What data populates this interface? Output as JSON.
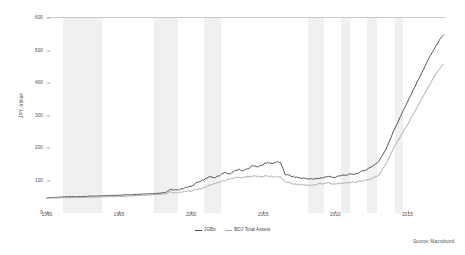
{
  "chart_data": {
    "type": "line",
    "title": "",
    "subtitle": "",
    "xlabel": "",
    "ylabel": "JPY, trillion",
    "xlim": [
      1990,
      2017.6
    ],
    "ylim": [
      0,
      600
    ],
    "grid": false,
    "legend_position": "bottom-center",
    "source": "Source: Macrobond",
    "y_ticks": [
      0,
      100,
      200,
      300,
      400,
      500,
      600
    ],
    "y_tick_labels": [
      "0",
      "100",
      "200",
      "300",
      "400",
      "500",
      "600"
    ],
    "x_ticks": [
      1990,
      1995,
      2000,
      2005,
      2010,
      2015
    ],
    "x_tick_labels": [
      "1990",
      "1995",
      "2000",
      "2005",
      "2010",
      "2015"
    ],
    "colors": {
      "jgbs": "#4c4c4c",
      "boj_total_assets": "#a6a6a6",
      "recession_band": "#f0f0f0",
      "axis": "#b9b9b9",
      "text": "#4a4a4a"
    },
    "recession_bands": [
      {
        "start": 1991.1,
        "end": 1993.8
      },
      {
        "start": 1997.4,
        "end": 1999.1
      },
      {
        "start": 2000.9,
        "end": 2002.1
      },
      {
        "start": 2008.1,
        "end": 2009.2
      },
      {
        "start": 2010.4,
        "end": 2011.0
      },
      {
        "start": 2012.2,
        "end": 2012.9
      },
      {
        "start": 2014.1,
        "end": 2014.7
      }
    ],
    "series": [
      {
        "name": "JGBs",
        "color": "#4c4c4c",
        "x": [
          1990.0,
          1990.5,
          1991.0,
          1991.5,
          1992.0,
          1992.5,
          1993.0,
          1993.5,
          1994.0,
          1994.5,
          1995.0,
          1995.5,
          1996.0,
          1996.5,
          1997.0,
          1997.5,
          1998.0,
          1998.3,
          1998.6,
          1999.0,
          1999.3,
          1999.6,
          2000.0,
          2000.3,
          2000.6,
          2001.0,
          2001.3,
          2001.6,
          2002.0,
          2002.3,
          2002.6,
          2003.0,
          2003.3,
          2003.6,
          2004.0,
          2004.3,
          2004.6,
          2005.0,
          2005.3,
          2005.6,
          2006.0,
          2006.2,
          2006.5,
          2007.0,
          2007.5,
          2008.0,
          2008.5,
          2009.0,
          2009.5,
          2010.0,
          2010.5,
          2011.0,
          2011.5,
          2012.0,
          2012.5,
          2013.0,
          2013.5,
          2014.0,
          2014.5,
          2015.0,
          2015.5,
          2016.0,
          2016.5,
          2017.0,
          2017.3,
          2017.5
        ],
        "y": [
          47,
          48,
          49,
          50,
          50,
          51,
          52,
          52,
          53,
          54,
          55,
          56,
          57,
          58,
          59,
          60,
          62,
          66,
          72,
          70,
          74,
          78,
          82,
          92,
          96,
          106,
          112,
          108,
          116,
          124,
          120,
          128,
          134,
          130,
          138,
          146,
          141,
          150,
          156,
          152,
          158,
          155,
          120,
          112,
          108,
          106,
          104,
          108,
          112,
          110,
          116,
          118,
          122,
          130,
          142,
          158,
          196,
          248,
          296,
          342,
          388,
          432,
          478,
          516,
          538,
          548
        ]
      },
      {
        "name": "BOJ Total Assets",
        "color": "#a6a6a6",
        "x": [
          1990.0,
          1990.5,
          1991.0,
          1991.5,
          1992.0,
          1992.5,
          1993.0,
          1993.5,
          1994.0,
          1994.5,
          1995.0,
          1995.5,
          1996.0,
          1996.5,
          1997.0,
          1997.5,
          1998.0,
          1998.3,
          1998.6,
          1999.0,
          1999.3,
          1999.6,
          2000.0,
          2000.3,
          2000.6,
          2001.0,
          2001.3,
          2001.6,
          2002.0,
          2002.3,
          2002.6,
          2003.0,
          2003.3,
          2003.6,
          2004.0,
          2004.3,
          2004.6,
          2005.0,
          2005.3,
          2005.6,
          2006.0,
          2006.2,
          2006.5,
          2007.0,
          2007.5,
          2008.0,
          2008.5,
          2009.0,
          2009.5,
          2010.0,
          2010.5,
          2011.0,
          2011.5,
          2012.0,
          2012.5,
          2013.0,
          2013.5,
          2014.0,
          2014.5,
          2015.0,
          2015.5,
          2016.0,
          2016.5,
          2017.0,
          2017.3,
          2017.5
        ],
        "y": [
          46,
          46,
          47,
          47,
          48,
          48,
          49,
          49,
          50,
          50,
          51,
          52,
          53,
          54,
          55,
          56,
          58,
          60,
          64,
          62,
          64,
          66,
          68,
          72,
          74,
          80,
          86,
          90,
          96,
          100,
          104,
          108,
          110,
          110,
          112,
          113,
          112,
          113,
          113,
          112,
          112,
          110,
          96,
          90,
          88,
          86,
          86,
          90,
          92,
          90,
          92,
          94,
          96,
          100,
          106,
          116,
          150,
          196,
          236,
          272,
          312,
          352,
          392,
          430,
          448,
          458
        ]
      }
    ]
  }
}
